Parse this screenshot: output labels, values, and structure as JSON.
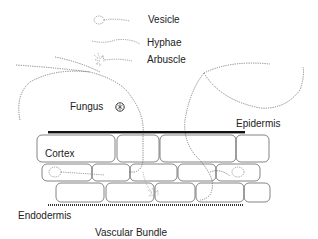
{
  "diagram": {
    "type": "anatomical-schematic"
  },
  "legend": {
    "items": [
      {
        "symbol": "vesicle-icon",
        "label": "Vesicle"
      },
      {
        "symbol": "hyphae-icon",
        "label": "Hyphae"
      },
      {
        "symbol": "arbuscle-icon",
        "label": "Arbuscle"
      }
    ]
  },
  "labels": {
    "fungus": "Fungus",
    "epidermis": "Epidermis",
    "cortex": "Cortex",
    "endodermis": "Endodermis",
    "vascular_bundle": "Vascular Bundle"
  },
  "colors": {
    "line": "#555555",
    "epidermis": "#111111",
    "cell_outline": "#666666",
    "hyphae": "#777777",
    "background": "#ffffff"
  }
}
